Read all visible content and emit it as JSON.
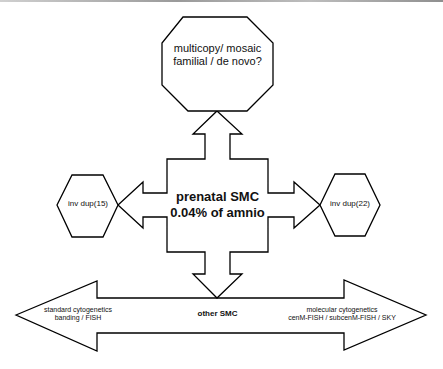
{
  "diagram": {
    "top_octagon": {
      "line1": "multicopy/ mosaic",
      "line2": "familial / de novo?"
    },
    "center": {
      "line1": "prenatal SMC",
      "line2": "0.04% of amnio"
    },
    "left_hexagon": {
      "label": "inv dup(15)"
    },
    "right_hexagon": {
      "label": "inv dup(22)"
    },
    "bottom_arrow": {
      "left": {
        "line1": "standard cytogenetics",
        "line2": "banding / FISH"
      },
      "middle": "other SMC",
      "right": {
        "line1": "molecular cytogenetics",
        "line2": "cenM-FISH / subcenM-FISH / SKY"
      }
    },
    "colors": {
      "stroke": "#000000",
      "fill": "#ffffff",
      "text": "#111111"
    }
  }
}
